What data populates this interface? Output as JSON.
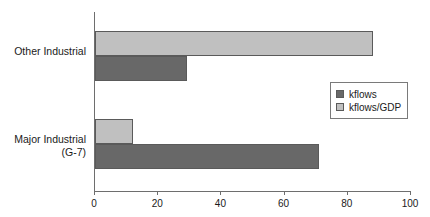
{
  "chart_data": {
    "type": "bar",
    "orientation": "horizontal",
    "title": "",
    "xlabel": "",
    "ylabel": "",
    "categories": [
      "Other Industrial",
      "Major Industrial\n(G-7)"
    ],
    "series": [
      {
        "name": "kflows",
        "color": "#686868",
        "values": [
          29,
          71
        ]
      },
      {
        "name": "kflows/GDP",
        "color": "#c0c0c0",
        "values": [
          88,
          12
        ]
      }
    ],
    "xlim": [
      0,
      100
    ],
    "xticks": [
      0,
      20,
      40,
      60,
      80,
      100
    ],
    "xtick_labels": [
      "0",
      "20",
      "40",
      "60",
      "80",
      "100"
    ],
    "grid": false,
    "legend_position": "center-right",
    "legend_entries": [
      "kflows",
      "kflows/GDP"
    ]
  },
  "legend": {
    "items": [
      {
        "label": "kflows",
        "swatch": "dark-gray-swatch"
      },
      {
        "label": "kflows/GDP",
        "swatch": "light-gray-swatch"
      }
    ]
  },
  "axis": {
    "tick_labels": [
      "0",
      "20",
      "40",
      "60",
      "80",
      "100"
    ]
  },
  "categories": [
    {
      "label": "Other Industrial"
    },
    {
      "label": "Major Industrial\n(G-7)"
    }
  ],
  "colors": {
    "series_kflows": "#686868",
    "series_kflows_gdp": "#c0c0c0",
    "axis": "#6e6e6e",
    "bar_border": "#5a5a5a",
    "background": "#ffffff"
  }
}
